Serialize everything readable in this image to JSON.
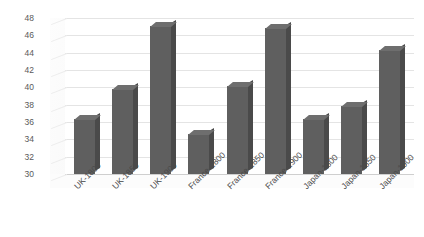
{
  "chart_data": {
    "type": "bar",
    "title": "",
    "subtitle": "",
    "xlabel": "",
    "ylabel": "",
    "categories": [
      "UK-1800",
      "UK-1850",
      "UK-1900",
      "France-1800",
      "France-1850",
      "France-1900",
      "Japan-1800",
      "Japan-1850",
      "Japan-1900"
    ],
    "values": [
      36.3,
      39.8,
      47.1,
      34.6,
      40.2,
      46.8,
      36.4,
      37.9,
      44.3
    ],
    "ylim": [
      30,
      48
    ],
    "ytick_step": 2,
    "yticks": [
      30,
      32,
      34,
      36,
      38,
      40,
      42,
      44,
      46,
      48
    ],
    "ytick_labels": [
      "30",
      "32",
      "34",
      "36",
      "38",
      "40",
      "42",
      "44",
      "46",
      "48"
    ],
    "grid": true,
    "grid_axis": "y",
    "legend": false,
    "legend_position": "none",
    "style": "3d-column",
    "bar_color": "#5f5f5f",
    "bar_side_color": "#4a4a4a",
    "bar_top_color": "#6e6e6e",
    "gridline_color": "#e4e4e4",
    "background_color": "#ffffff",
    "axis_label_color": "#5a5a5a",
    "xtick_rotation": -45
  }
}
